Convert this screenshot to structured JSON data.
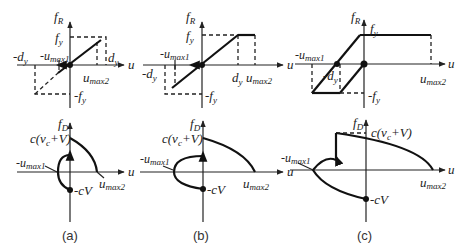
{
  "figure": {
    "panels": [
      {
        "id": "a",
        "caption": "(a)",
        "top": {
          "y_axis": "f",
          "y_sub": "R",
          "x_axis": "u",
          "labels": {
            "fy": "f",
            "fy_sub": "y",
            "neg_fy": "-f",
            "neg_fy_sub": "y",
            "neg_dy": "-d",
            "neg_dy_sub": "y",
            "dy": "d",
            "dy_sub": "y",
            "neg_umax1": "-u",
            "neg_umax1_sub": "max1",
            "umax2": "u",
            "umax2_sub": "max2"
          }
        },
        "bottom": {
          "y_axis": "f",
          "y_sub": "D",
          "x_axis": "u",
          "labels": {
            "top": "c(v",
            "top_sub": "c",
            "top_end": "+V)",
            "neg_umax1": "-u",
            "neg_umax1_sub": "max1",
            "umax2": "u",
            "umax2_sub": "max2",
            "neg_cv": "-cV"
          }
        }
      },
      {
        "id": "b",
        "caption": "(b)",
        "top": {
          "y_axis": "f",
          "y_sub": "R",
          "x_axis": "u",
          "labels": {
            "fy": "f",
            "fy_sub": "y",
            "neg_fy": "-f",
            "neg_fy_sub": "y",
            "neg_dy": "-d",
            "neg_dy_sub": "y",
            "dy": "d",
            "dy_sub": "y",
            "neg_umax1": "-u",
            "neg_umax1_sub": "max1",
            "umax2": "u",
            "umax2_sub": "max2"
          }
        },
        "bottom": {
          "y_axis": "f",
          "y_sub": "D",
          "x_axis": "u",
          "labels": {
            "top": "c(v",
            "top_sub": "c",
            "top_end": "+V)",
            "neg_umax1": "-u",
            "neg_umax1_sub": "max1",
            "umax2": "u",
            "umax2_sub": "max2",
            "neg_cv": "-cV"
          }
        }
      },
      {
        "id": "c",
        "caption": "(c)",
        "top": {
          "y_axis": "f",
          "y_sub": "R",
          "x_axis": "u",
          "labels": {
            "fy": "f",
            "fy_sub": "y",
            "neg_fy": "-f",
            "neg_fy_sub": "y",
            "neg_dy": "-d",
            "neg_dy_sub": "y",
            "neg_umax1": "-u",
            "neg_umax1_sub": "max1",
            "umax2": "u",
            "umax2_sub": "max2"
          }
        },
        "bottom": {
          "y_axis": "f",
          "y_sub": "D",
          "x_axis": "u",
          "labels": {
            "top": "c(v",
            "top_sub": "c",
            "top_end": "+V)",
            "neg_umax1": "-u",
            "neg_umax1_sub": "max1",
            "umax2": "u",
            "umax2_sub": "max2",
            "neg_cv": "-cV"
          }
        }
      }
    ]
  }
}
